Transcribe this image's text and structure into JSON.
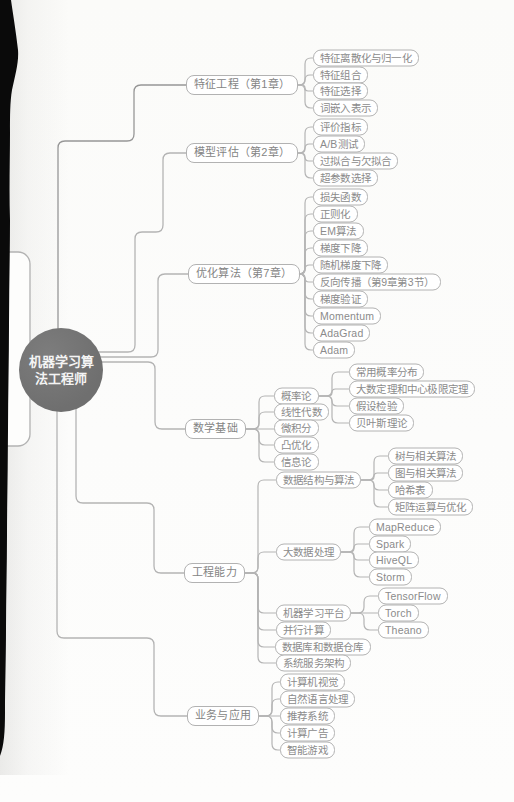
{
  "center": {
    "label": "机器学习算法工程师"
  },
  "colors": {
    "background": "#fbfbfa",
    "node_border": "#b2b2b2",
    "node_text": "#8b8b8b",
    "branch_text": "#848484",
    "connector": "#b4b4b4",
    "connector_dark": "#979797",
    "center_fill": "#6f6f6f",
    "center_text": "#f4f4f4",
    "page_edge": "#0a0a0a"
  },
  "nodes": [
    {
      "id": "fe",
      "parent": "root",
      "label": "特征工程（第1章）"
    },
    {
      "id": "fe1",
      "parent": "fe",
      "label": "特征离散化与归一化"
    },
    {
      "id": "fe2",
      "parent": "fe",
      "label": "特征组合"
    },
    {
      "id": "fe3",
      "parent": "fe",
      "label": "特征选择"
    },
    {
      "id": "fe4",
      "parent": "fe",
      "label": "词嵌入表示"
    },
    {
      "id": "me",
      "parent": "root",
      "label": "模型评估（第2章）"
    },
    {
      "id": "me1",
      "parent": "me",
      "label": "评价指标"
    },
    {
      "id": "me2",
      "parent": "me",
      "label": "A/B测试"
    },
    {
      "id": "me3",
      "parent": "me",
      "label": "过拟合与欠拟合"
    },
    {
      "id": "me4",
      "parent": "me",
      "label": "超参数选择"
    },
    {
      "id": "oa",
      "parent": "root",
      "label": "优化算法（第7章）"
    },
    {
      "id": "oa1",
      "parent": "oa",
      "label": "损失函数"
    },
    {
      "id": "oa2",
      "parent": "oa",
      "label": "正则化"
    },
    {
      "id": "oa3",
      "parent": "oa",
      "label": "EM算法"
    },
    {
      "id": "oa4",
      "parent": "oa",
      "label": "梯度下降"
    },
    {
      "id": "oa5",
      "parent": "oa",
      "label": "随机梯度下降"
    },
    {
      "id": "oa6",
      "parent": "oa",
      "label": "反向传播（第9章第3节）"
    },
    {
      "id": "oa7",
      "parent": "oa",
      "label": "梯度验证"
    },
    {
      "id": "oa8",
      "parent": "oa",
      "label": "Momentum"
    },
    {
      "id": "oa9",
      "parent": "oa",
      "label": "AdaGrad"
    },
    {
      "id": "oa10",
      "parent": "oa",
      "label": "Adam"
    },
    {
      "id": "mb",
      "parent": "root",
      "label": "数学基础"
    },
    {
      "id": "mb1",
      "parent": "mb",
      "label": "概率论"
    },
    {
      "id": "mb1a",
      "parent": "mb1",
      "label": "常用概率分布"
    },
    {
      "id": "mb1b",
      "parent": "mb1",
      "label": "大数定理和中心极限定理"
    },
    {
      "id": "mb1c",
      "parent": "mb1",
      "label": "假设检验"
    },
    {
      "id": "mb1d",
      "parent": "mb1",
      "label": "贝叶斯理论"
    },
    {
      "id": "mb2",
      "parent": "mb",
      "label": "线性代数"
    },
    {
      "id": "mb3",
      "parent": "mb",
      "label": "微积分"
    },
    {
      "id": "mb4",
      "parent": "mb",
      "label": "凸优化"
    },
    {
      "id": "mb5",
      "parent": "mb",
      "label": "信息论"
    },
    {
      "id": "ec",
      "parent": "root",
      "label": "工程能力"
    },
    {
      "id": "ec1",
      "parent": "ec",
      "label": "数据结构与算法"
    },
    {
      "id": "ec1a",
      "parent": "ec1",
      "label": "树与相关算法"
    },
    {
      "id": "ec1b",
      "parent": "ec1",
      "label": "图与相关算法"
    },
    {
      "id": "ec1c",
      "parent": "ec1",
      "label": "哈希表"
    },
    {
      "id": "ec1d",
      "parent": "ec1",
      "label": "矩阵运算与优化"
    },
    {
      "id": "ec2",
      "parent": "ec",
      "label": "大数据处理"
    },
    {
      "id": "ec2a",
      "parent": "ec2",
      "label": "MapReduce"
    },
    {
      "id": "ec2b",
      "parent": "ec2",
      "label": "Spark"
    },
    {
      "id": "ec2c",
      "parent": "ec2",
      "label": "HiveQL"
    },
    {
      "id": "ec2d",
      "parent": "ec2",
      "label": "Storm"
    },
    {
      "id": "ec3",
      "parent": "ec",
      "label": "机器学习平台"
    },
    {
      "id": "ec3a",
      "parent": "ec3",
      "label": "TensorFlow"
    },
    {
      "id": "ec3b",
      "parent": "ec3",
      "label": "Torch"
    },
    {
      "id": "ec3c",
      "parent": "ec3",
      "label": "Theano"
    },
    {
      "id": "ec4",
      "parent": "ec",
      "label": "并行计算"
    },
    {
      "id": "ec5",
      "parent": "ec",
      "label": "数据库和数据仓库"
    },
    {
      "id": "ec6",
      "parent": "ec",
      "label": "系统服务架构"
    },
    {
      "id": "ba",
      "parent": "root",
      "label": "业务与应用"
    },
    {
      "id": "ba1",
      "parent": "ba",
      "label": "计算机视觉"
    },
    {
      "id": "ba2",
      "parent": "ba",
      "label": "自然语言处理"
    },
    {
      "id": "ba3",
      "parent": "ba",
      "label": "推荐系统"
    },
    {
      "id": "ba4",
      "parent": "ba",
      "label": "计算广告"
    },
    {
      "id": "ba5",
      "parent": "ba",
      "label": "智能游戏"
    }
  ]
}
